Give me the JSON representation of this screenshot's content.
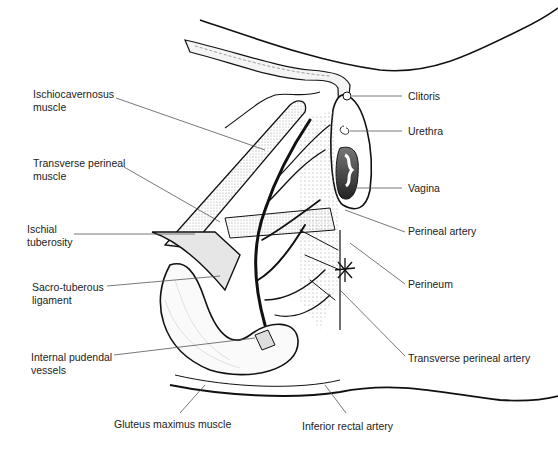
{
  "diagram": {
    "colors": {
      "outline": "#111111",
      "leader": "#555555",
      "label_text": "#222222",
      "vagina_fill": "#444444",
      "stipple": "#cccccc",
      "ligament_fill": "#d9d9d9"
    },
    "labels_left": [
      {
        "id": "ischiocavernosus",
        "lines": [
          "Ischiocavernosus",
          "muscle"
        ]
      },
      {
        "id": "transverse-perineal-muscle",
        "lines": [
          "Transverse perineal",
          "muscle"
        ]
      },
      {
        "id": "ischial-tuberosity",
        "lines": [
          "Ischial",
          "tuberosity"
        ]
      },
      {
        "id": "sacro-tuberous-ligament",
        "lines": [
          "Sacro-tuberous",
          "ligament"
        ]
      },
      {
        "id": "internal-pudendal-vessels",
        "lines": [
          "Internal pudendal",
          "vessels"
        ]
      }
    ],
    "labels_right": [
      {
        "id": "clitoris",
        "text": "Clitoris"
      },
      {
        "id": "urethra",
        "text": "Urethra"
      },
      {
        "id": "vagina",
        "text": "Vagina"
      },
      {
        "id": "perineal-artery",
        "text": "Perineal artery"
      },
      {
        "id": "perineum",
        "text": "Perineum"
      },
      {
        "id": "transverse-perineal-artery",
        "text": "Transverse perineal artery"
      }
    ],
    "labels_bottom": [
      {
        "id": "gluteus-maximus",
        "text": "Gluteus maximus muscle"
      },
      {
        "id": "inferior-rectal-artery",
        "text": "Inferior rectal artery"
      }
    ]
  }
}
